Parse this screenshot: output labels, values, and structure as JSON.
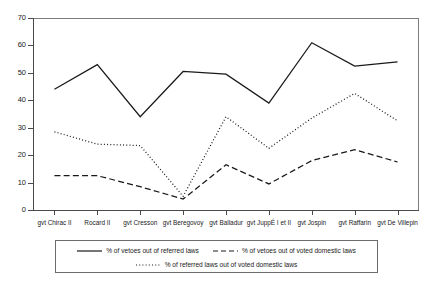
{
  "chart_data": {
    "type": "line",
    "title": "",
    "subtitle": "",
    "xlabel": "",
    "ylabel": "",
    "ylim": [
      0,
      70
    ],
    "yticks": [
      0,
      10,
      20,
      30,
      40,
      50,
      60,
      70
    ],
    "grid": false,
    "legend_position": "bottom",
    "categories": [
      "gvt Chirac II",
      "Rocard II",
      "gvt Cresson",
      "gvt Beregovoy",
      "gvt Balladur",
      "gvt JuppÉ I et II",
      "gvt Jospin",
      "gvt Raffarin",
      "gvt De Villepin"
    ],
    "series": [
      {
        "name": "% of vetoes out of referred laws",
        "style": "solid",
        "color": "#1a1a1a",
        "values": [
          44,
          53,
          34,
          50.5,
          49.5,
          39,
          61,
          52.5,
          54
        ]
      },
      {
        "name": "% of vetoes out of voted domestic laws",
        "style": "dashed",
        "color": "#1a1a1a",
        "values": [
          12.5,
          12.5,
          8.5,
          4,
          16.5,
          9.5,
          18,
          22,
          17.5
        ]
      },
      {
        "name": "% of referred laws out of voted domestic laws",
        "style": "dotted",
        "color": "#1a1a1a",
        "values": [
          28.5,
          24,
          23.5,
          5,
          34,
          22.5,
          33.5,
          42.5,
          32.5
        ]
      }
    ]
  },
  "axis": {
    "y_tick_labels": [
      "0",
      "10",
      "20",
      "30",
      "40",
      "50",
      "60",
      "70"
    ]
  },
  "legend": {
    "items": [
      {
        "label": "% of vetoes out of referred laws",
        "style": "solid"
      },
      {
        "label": "% of vetoes out of voted domestic laws",
        "style": "dashed"
      },
      {
        "label": "% of referred laws out of voted domestic laws",
        "style": "dotted"
      }
    ]
  }
}
